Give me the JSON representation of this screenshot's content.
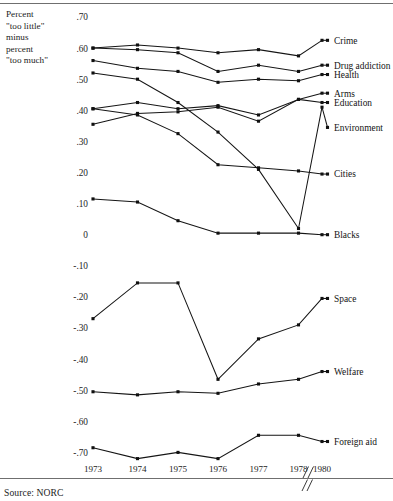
{
  "figure": {
    "y_caption": "Percent\n\"too little\"\nminus\npercent\n\"too much\"",
    "source": "Source: NORC",
    "source_prefix": "S",
    "source_rest": "OURCE",
    "source_tail": ": NORC"
  },
  "chart_data": {
    "type": "line",
    "title": "",
    "subtitle": "",
    "xlabel": "",
    "ylabel": "Percent \"too little\" minus percent \"too much\"",
    "x": [
      "1973",
      "1974",
      "1975",
      "1976",
      "1977",
      "1978",
      "1980"
    ],
    "x_tick_labels": [
      "1973",
      "1974",
      "1975",
      "1976",
      "1977",
      "1978",
      "1980"
    ],
    "axis_break_between": [
      "1978",
      "1980"
    ],
    "axis_break_symbol": "//",
    "ylim": [
      -0.75,
      0.72
    ],
    "y_ticks": [
      0.7,
      0.6,
      0.5,
      0.4,
      0.3,
      0.2,
      0.1,
      0.0,
      -0.1,
      -0.2,
      -0.3,
      -0.4,
      -0.5,
      -0.6,
      -0.7
    ],
    "y_tick_labels": [
      ".70",
      ".60",
      ".50",
      ".40",
      ".30",
      ".20",
      ".10",
      "0",
      "-.10",
      "-.20",
      "-.30",
      "-.40",
      "-.50",
      "-.60",
      "-.70"
    ],
    "grid": false,
    "legend": "right-inline-labels",
    "marker": "filled-square",
    "series": [
      {
        "name": "Crime",
        "label": "Crime",
        "values": [
          0.6,
          0.61,
          0.6,
          0.585,
          0.595,
          0.575,
          0.625
        ]
      },
      {
        "name": "Drug addiction",
        "label": "Drug addiction",
        "values": [
          0.6,
          0.595,
          0.585,
          0.525,
          0.545,
          0.525,
          0.545
        ]
      },
      {
        "name": "Health",
        "label": "Health",
        "values": [
          0.56,
          0.535,
          0.525,
          0.49,
          0.5,
          0.495,
          0.515
        ]
      },
      {
        "name": "Arms",
        "label": "Arms",
        "values": [
          0.405,
          0.425,
          0.405,
          0.415,
          0.385,
          0.435,
          0.455
        ]
      },
      {
        "name": "Education",
        "label": "Education",
        "values": [
          0.355,
          0.39,
          0.395,
          0.41,
          0.365,
          0.435,
          0.425
        ]
      },
      {
        "name": "Environment",
        "label": "Environment",
        "values": [
          0.52,
          0.5,
          0.425,
          0.33,
          0.21,
          0.02,
          0.41
        ]
      },
      {
        "name": "Cities",
        "label": "Cities",
        "values": [
          0.405,
          0.385,
          0.325,
          0.225,
          0.215,
          0.205,
          0.195
        ]
      },
      {
        "name": "Blacks",
        "label": "Blacks",
        "values": [
          0.115,
          0.105,
          0.045,
          0.005,
          0.005,
          0.005,
          0.0
        ]
      },
      {
        "name": "Space",
        "label": "Space",
        "values": [
          -0.27,
          -0.155,
          -0.155,
          -0.465,
          -0.335,
          -0.29,
          -0.205
        ]
      },
      {
        "name": "Welfare",
        "label": "Welfare",
        "values": [
          -0.505,
          -0.515,
          -0.505,
          -0.51,
          -0.48,
          -0.465,
          -0.44
        ]
      },
      {
        "name": "Foreign aid",
        "label": "Foreign aid",
        "values": [
          -0.685,
          -0.72,
          -0.7,
          -0.72,
          -0.645,
          -0.645,
          -0.665
        ]
      }
    ],
    "label_positions": {
      "Crime": 0.625,
      "Drug addiction": 0.545,
      "Health": 0.515,
      "Arms": 0.455,
      "Education": 0.425,
      "Environment": 0.345,
      "Cities": 0.195,
      "Blacks": 0.0,
      "Space": -0.205,
      "Welfare": -0.44,
      "Foreign aid": -0.665
    }
  }
}
